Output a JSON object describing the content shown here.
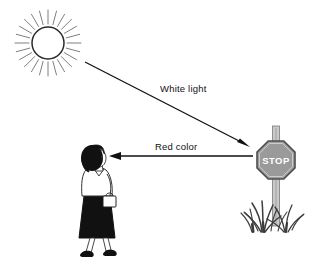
{
  "diagram": {
    "background_color": "#ffffff",
    "stroke_color": "#1a1a1a",
    "labels": {
      "white_light": "White light",
      "red_color": "Red color"
    },
    "sun": {
      "name": "sun",
      "center_x": 48,
      "center_y": 43,
      "radius": 16,
      "ray_count": 24,
      "ray_inner": 19,
      "ray_outer": 33,
      "outline_color": "#1a1a1a",
      "fill_color": "#ffffff"
    },
    "stop_sign": {
      "name": "stop-sign",
      "text": "STOP",
      "center_x": 276,
      "center_y": 160,
      "radius": 19,
      "face_color": "#9a9a9a",
      "border_color": "#4a4a4a",
      "text_color": "#ffffff",
      "post_color": "#bdbdbd",
      "post_top_y": 126,
      "post_bottom_y": 224
    },
    "person": {
      "name": "woman-pedestrian",
      "hair_color": "#111111",
      "skin_color": "#ffffff",
      "blouse_color": "#ffffff",
      "skirt_color": "#111111",
      "shoe_color": "#111111",
      "handbag_color": "#ffffff",
      "x": 95,
      "y": 200
    },
    "grass": {
      "name": "grass-tuft",
      "color": "#3c3c3c",
      "base_y": 232
    },
    "arrows": [
      {
        "name": "white-light-arrow",
        "label": "White light",
        "from": "sun",
        "to": "stop-sign",
        "x1": 85,
        "y1": 62,
        "x2": 249,
        "y2": 146,
        "color": "#111111",
        "label_x": 160,
        "label_y": 92
      },
      {
        "name": "red-color-arrow",
        "label": "Red color",
        "from": "stop-sign",
        "to": "woman-pedestrian",
        "x1": 253,
        "y1": 156,
        "x2": 110,
        "y2": 156,
        "color": "#111111",
        "label_x": 155,
        "label_y": 150
      }
    ]
  }
}
